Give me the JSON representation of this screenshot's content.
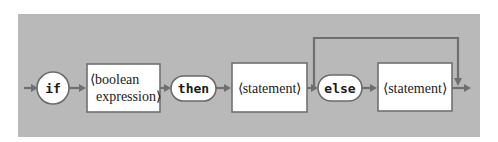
{
  "diagram": {
    "type": "syntax-diagram",
    "title": "",
    "nodes": [
      {
        "id": "if",
        "kind": "terminal",
        "shape": "circle",
        "label": "if"
      },
      {
        "id": "bool",
        "kind": "nonterminal",
        "shape": "box",
        "label_lines": [
          "⟨boolean",
          "expression⟩"
        ]
      },
      {
        "id": "then",
        "kind": "terminal",
        "shape": "pill",
        "label": "then"
      },
      {
        "id": "stmt1",
        "kind": "nonterminal",
        "shape": "box",
        "label": "⟨statement⟩"
      },
      {
        "id": "else",
        "kind": "terminal",
        "shape": "pill",
        "label": "else"
      },
      {
        "id": "stmt2",
        "kind": "nonterminal",
        "shape": "box",
        "label": "⟨statement⟩"
      }
    ],
    "edges": [
      {
        "from": "start",
        "to": "if"
      },
      {
        "from": "if",
        "to": "bool"
      },
      {
        "from": "bool",
        "to": "then"
      },
      {
        "from": "then",
        "to": "stmt1"
      },
      {
        "from": "stmt1",
        "to": "else"
      },
      {
        "from": "else",
        "to": "stmt2"
      },
      {
        "from": "stmt2",
        "to": "end"
      },
      {
        "from": "stmt1",
        "to": "end",
        "kind": "bypass"
      }
    ],
    "colors": {
      "panel": "#b9b9b9",
      "line": "#6f6f6f",
      "node_fill": "#ffffff"
    }
  }
}
